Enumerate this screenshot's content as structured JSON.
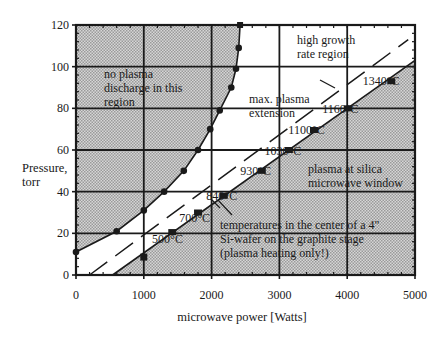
{
  "chart_data": {
    "type": "line",
    "title": "",
    "xlabel": "microwave power [Watts]",
    "ylabel": "Pressure,\ntorr",
    "ylabel_lines": [
      "Pressure,",
      "torr"
    ],
    "xlim": [
      0,
      5000
    ],
    "ylim": [
      0,
      120
    ],
    "xticks": [
      0,
      1000,
      2000,
      3000,
      4000,
      5000
    ],
    "xtick_labels": [
      "0",
      "1000",
      "2000",
      "3000",
      "4000",
      "5000"
    ],
    "yticks": [
      0,
      20,
      40,
      60,
      80,
      100,
      120
    ],
    "ytick_labels": [
      "0",
      "20",
      "40",
      "60",
      "80",
      "100",
      "120"
    ],
    "grid": true,
    "legend": null,
    "series": [
      {
        "name": "plasma discharge boundary (left)",
        "marker": "circle",
        "x": [
          0,
          600,
          1000,
          1300,
          1590,
          1800,
          1980,
          2120,
          2290,
          2360,
          2400,
          2420
        ],
        "y": [
          11,
          21,
          31,
          40,
          50,
          60,
          70,
          79,
          90,
          99,
          109,
          120
        ]
      },
      {
        "name": "plasma at silica window boundary (right)",
        "marker": "square",
        "x": [
          1420,
          1800,
          2180,
          2740,
          3140,
          3510,
          4010,
          4650
        ],
        "y": [
          20.6,
          30,
          38,
          50,
          60,
          69.6,
          80,
          93
        ]
      },
      {
        "name": "isolated point",
        "marker": "square",
        "x": [
          1000
        ],
        "y": [
          8.6
        ]
      },
      {
        "name": "max. plasma extension (dashed)",
        "marker": "none",
        "x": [
          200,
          4900
        ],
        "y": [
          0,
          113
        ]
      }
    ],
    "shaded_regions": [
      {
        "name": "no plasma discharge in this region",
        "side": "left of left boundary"
      },
      {
        "name": "plasma at silica microwave window",
        "side": "right of right boundary"
      }
    ],
    "annotations": [
      {
        "text": "no plasma discharge in this region",
        "lines": [
          "no plasma",
          "discharge in this",
          "region"
        ]
      },
      {
        "text": "high growth rate region",
        "lines": [
          "high growth",
          "rate region"
        ]
      },
      {
        "text": "max. plasma extension",
        "lines": [
          "max. plasma",
          "extension"
        ]
      },
      {
        "text": "plasma at silica microwave window",
        "lines": [
          "plasma at silica",
          "microwave window"
        ]
      },
      {
        "text": "temperatures in the center of a 4\" Si-wafer on the graphite stage (plasma heating only!)",
        "lines": [
          "temperatures in the center of a 4\"",
          "Si-wafer on the graphite stage",
          "(plasma heating only!)"
        ]
      }
    ],
    "temperature_labels": [
      {
        "text": "500°C",
        "x": 1350,
        "y": 15.5
      },
      {
        "text": "700°C",
        "x": 1750,
        "y": 25.5
      },
      {
        "text": "840°C",
        "x": 2150,
        "y": 36
      },
      {
        "text": "930°C",
        "x": 2650,
        "y": 48
      },
      {
        "text": "1030°C",
        "x": 3050,
        "y": 57.5
      },
      {
        "text": "1100°C",
        "x": 3400,
        "y": 67.5
      },
      {
        "text": "1160°C",
        "x": 3900,
        "y": 78
      },
      {
        "text": "1340°C",
        "x": 4500,
        "y": 91
      }
    ]
  },
  "colors": {
    "shade": "#c8c8c8",
    "line": "#1a1a1a",
    "background": "#ffffff"
  }
}
